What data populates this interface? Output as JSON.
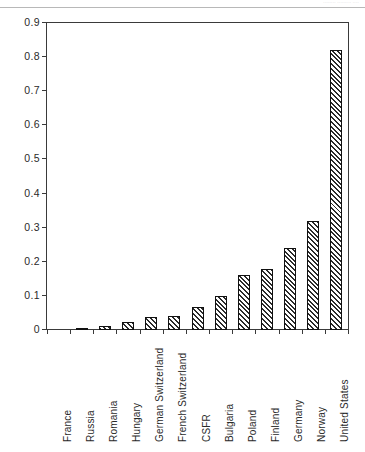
{
  "artifact": {
    "ghost_text": "........ ......... ...."
  },
  "chart_data": {
    "type": "bar",
    "title": "",
    "xlabel": "",
    "ylabel": "hours",
    "ylim": [
      0,
      0.9
    ],
    "ytick_labels": [
      "0.9",
      "0.8",
      "0.7",
      "0.6",
      "0.5",
      "0.4",
      "0.3",
      "0.2",
      "0.1",
      "0"
    ],
    "ytick_values": [
      0.9,
      0.8,
      0.7,
      0.6,
      0.5,
      0.4,
      0.3,
      0.2,
      0.1,
      0
    ],
    "grid": false,
    "legend": false,
    "bar_style": "diagonal-hatch",
    "categories": [
      "France",
      "Russia",
      "Romania",
      "Hungary",
      "German Switzerland",
      "French Switzerland",
      "CSFR",
      "Bulgaria",
      "Poland",
      "Finland",
      "Germany",
      "Norway",
      "United States"
    ],
    "values": [
      0.0,
      0.005,
      0.012,
      0.023,
      0.038,
      0.04,
      0.068,
      0.1,
      0.16,
      0.18,
      0.24,
      0.32,
      0.82
    ]
  }
}
